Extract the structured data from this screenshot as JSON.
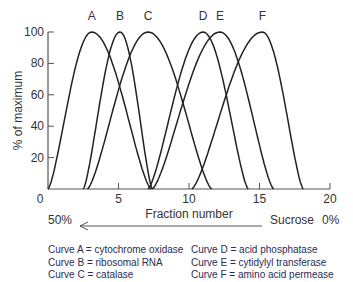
{
  "chart_data": {
    "type": "line",
    "title": "",
    "xlabel": "Fraction number",
    "ylabel": "% of maximum",
    "xlim": [
      0,
      20
    ],
    "ylim": [
      0,
      100
    ],
    "x_ticks": [
      0,
      5,
      10,
      15,
      20
    ],
    "y_ticks": [
      0,
      20,
      40,
      60,
      80,
      100
    ],
    "grid": false,
    "series": [
      {
        "name": "A",
        "label": "cytochrome oxidase",
        "start": 0.0,
        "peak": 3.1,
        "end": 7.3,
        "peak_value": 100
      },
      {
        "name": "B",
        "label": "ribosomal RNA",
        "start": 2.5,
        "peak": 5.1,
        "end": 7.4,
        "peak_value": 100
      },
      {
        "name": "C",
        "label": "catalase",
        "start": 2.8,
        "peak": 7.1,
        "end": 11.6,
        "peak_value": 100
      },
      {
        "name": "D",
        "label": "acid phosphatase",
        "start": 7.1,
        "peak": 11.0,
        "end": 14.2,
        "peak_value": 100
      },
      {
        "name": "E",
        "label": "cytidylyl transferase",
        "start": 7.4,
        "peak": 12.2,
        "end": 16.0,
        "peak_value": 100
      },
      {
        "name": "F",
        "label": "amino acid permease",
        "start": 10.2,
        "peak": 15.2,
        "end": 18.1,
        "peak_value": 100
      }
    ],
    "annotations": {
      "gradient_left": "50%",
      "gradient_right_label": "Sucrose",
      "gradient_right_value": "0%"
    }
  },
  "axis": {
    "origin_label": "0",
    "x_tick_labels": [
      "5",
      "10",
      "15",
      "20"
    ],
    "y_tick_labels": [
      "20",
      "40",
      "60",
      "80",
      "100"
    ]
  },
  "gradient": {
    "left": "50%",
    "right_label": "Sucrose",
    "right_value": "0%"
  },
  "legend": {
    "left": [
      "Curve A = cytochrome oxidase",
      "Curve B = ribosomal RNA",
      "Curve C = catalase"
    ],
    "right": [
      "Curve D = acid phosphatase",
      "Curve E = cytidylyl transferase",
      "Curve F = amino acid permease"
    ]
  },
  "colors": {
    "curve": "#222222",
    "axis": "#555555",
    "legend_text": "#2b2b5a"
  }
}
